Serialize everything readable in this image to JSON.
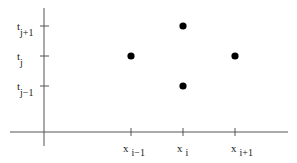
{
  "diagram": {
    "type": "finite-difference-stencil",
    "x_axis": {
      "ticks": [
        {
          "base": "x",
          "sub": "i−1"
        },
        {
          "base": "x",
          "sub": "i"
        },
        {
          "base": "x",
          "sub": "i+1"
        }
      ]
    },
    "y_axis": {
      "ticks": [
        {
          "base": "t",
          "sub": "j+1"
        },
        {
          "base": "t",
          "sub": "j"
        },
        {
          "base": "t",
          "sub": "j−1"
        }
      ]
    },
    "points": [
      {
        "x": "x_{i-1}",
        "t": "t_j"
      },
      {
        "x": "x_i",
        "t": "t_{j+1}"
      },
      {
        "x": "x_i",
        "t": "t_{j-1}"
      },
      {
        "x": "x_{i+1}",
        "t": "t_j"
      }
    ],
    "colors": {
      "axis": "#555555",
      "point": "#000000",
      "text": "#222222"
    }
  }
}
